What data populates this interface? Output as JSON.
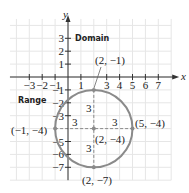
{
  "figure": {
    "origin_px": [
      68,
      77
    ],
    "unit_px": 12.9,
    "grid": {
      "x_min": -4.5,
      "x_max": 8,
      "y_min": -8,
      "y_max": 4.5
    },
    "axes": {
      "x_label": "x",
      "y_label": "y"
    },
    "x_ticks": [
      {
        "value": -3,
        "label": "−3"
      },
      {
        "value": -2,
        "label": "−2"
      },
      {
        "value": -1,
        "label": "−1"
      },
      {
        "value": 1,
        "label": "1"
      },
      {
        "value": 3,
        "label": "3"
      },
      {
        "value": 4,
        "label": "4"
      },
      {
        "value": 5,
        "label": "5"
      },
      {
        "value": 6,
        "label": "6"
      },
      {
        "value": 7,
        "label": "7"
      }
    ],
    "y_ticks": [
      {
        "value": 3,
        "label": "3"
      },
      {
        "value": 2,
        "label": "2"
      },
      {
        "value": 1,
        "label": "1"
      },
      {
        "value": -1,
        "label": "−1"
      },
      {
        "value": -2,
        "label": "−2"
      },
      {
        "value": -3,
        "label": "−3"
      },
      {
        "value": -5,
        "label": "−5"
      },
      {
        "value": -6,
        "label": "−6"
      },
      {
        "value": -7,
        "label": "−7"
      }
    ],
    "circle": {
      "center": [
        2,
        -4
      ],
      "radius": 3,
      "color": "#8a8a8a"
    },
    "points": [
      {
        "name": "top",
        "coord": [
          2,
          -1
        ],
        "label": "(2, −1)"
      },
      {
        "name": "center",
        "coord": [
          2,
          -4
        ],
        "label": "(2, −4)"
      },
      {
        "name": "left",
        "coord": [
          -1,
          -4
        ],
        "label": "(−1, −4)"
      },
      {
        "name": "right",
        "coord": [
          5,
          -4
        ],
        "label": "(5, −4)"
      },
      {
        "name": "bottom",
        "coord": [
          2,
          -7
        ],
        "label": "(2, −7)"
      }
    ],
    "radius_labels": [
      "3",
      "3",
      "3",
      "3"
    ],
    "annotations": {
      "domain": "Domain",
      "range": "Range"
    },
    "colors": {
      "grid": "#e6e6e6",
      "axis": "#333333",
      "circle": "#8a8a8a",
      "dash": "#8a8a8a",
      "text": "#222222"
    }
  }
}
